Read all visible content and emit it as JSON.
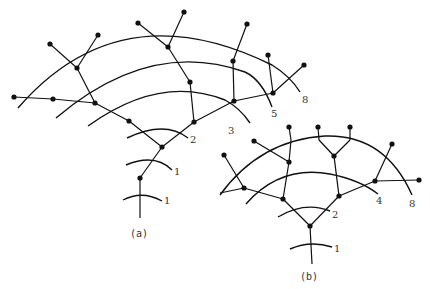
{
  "figure_a": {
    "caption": "(a)",
    "arc_labels": {
      "l1a": "1",
      "l1b": "1",
      "l2": "2",
      "l3": "3",
      "l5": "5",
      "l8": "8"
    }
  },
  "figure_b": {
    "caption": "(b)",
    "arc_labels": {
      "l1": "1",
      "l2": "2",
      "l4": "4",
      "l8": "8"
    }
  },
  "colors": {
    "ink": "#111111",
    "background": "#ffffff"
  }
}
